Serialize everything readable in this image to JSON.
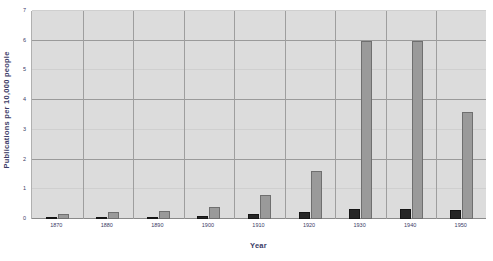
{
  "chart_data": {
    "type": "bar",
    "title": "",
    "subtitle": "",
    "xlabel": "Year",
    "ylabel": "Publications per 10,000 people",
    "categories": [
      "1870",
      "1880",
      "1890",
      "1900",
      "1910",
      "1920",
      "1930",
      "1940",
      "1950"
    ],
    "ylim": [
      0,
      7
    ],
    "yticks": [
      "0",
      "1",
      "2",
      "3",
      "4",
      "5",
      "6",
      "7"
    ],
    "grid": true,
    "grid_axis": "y",
    "legend": "none",
    "series": [
      {
        "name": "series-a",
        "color": "#262626",
        "values": [
          0.07,
          0.07,
          0.07,
          0.1,
          0.17,
          0.22,
          0.35,
          0.35,
          0.32
        ]
      },
      {
        "name": "series-b",
        "color": "#9a9a9a",
        "values": [
          0.16,
          0.25,
          0.26,
          0.42,
          0.82,
          1.62,
          6.0,
          6.0,
          3.6
        ]
      }
    ]
  },
  "axis": {
    "y_title": "Publications per 10,000 people",
    "x_title": "Year"
  }
}
